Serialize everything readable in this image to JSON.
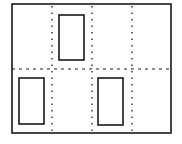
{
  "diagram": {
    "type": "layout-grid",
    "canvas": {
      "width": 182,
      "height": 144,
      "background": "#ffffff"
    },
    "stroke_color": "#1a1a1a",
    "outer_frame": {
      "x": 12,
      "y": 4,
      "width": 159,
      "height": 129
    },
    "grid": {
      "columns": 4,
      "rows": 2,
      "vertical_dividers_x": [
        52,
        92,
        132
      ],
      "horizontal_divider_y": 69,
      "divider_style": "dotted"
    },
    "blocks": [
      {
        "id": "block-top",
        "cell": {
          "row": 0,
          "col": 1
        },
        "x": 59,
        "y": 15,
        "width": 25,
        "height": 45
      },
      {
        "id": "block-bottom-left",
        "cell": {
          "row": 1,
          "col": 0
        },
        "x": 19,
        "y": 78,
        "width": 25,
        "height": 46
      },
      {
        "id": "block-bottom-right",
        "cell": {
          "row": 1,
          "col": 2
        },
        "x": 98,
        "y": 78,
        "width": 25,
        "height": 47
      }
    ]
  }
}
